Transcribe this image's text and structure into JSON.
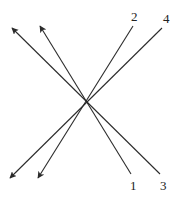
{
  "diagram": {
    "intersection": {
      "x": 85,
      "y": 103
    },
    "lines": [
      {
        "id": "1",
        "label": "1",
        "from": {
          "x": 131,
          "y": 174
        },
        "to": {
          "x": 40,
          "y": 26
        },
        "arrow_at": "to",
        "label_pos": {
          "x": 130,
          "y": 190
        }
      },
      {
        "id": "3",
        "label": "3",
        "from": {
          "x": 160,
          "y": 174
        },
        "to": {
          "x": 12,
          "y": 28
        },
        "arrow_at": "to",
        "label_pos": {
          "x": 160,
          "y": 190
        }
      },
      {
        "id": "2",
        "label": "2",
        "from": {
          "x": 133,
          "y": 26
        },
        "to": {
          "x": 38,
          "y": 178
        },
        "arrow_at": "to",
        "label_pos": {
          "x": 131,
          "y": 21
        }
      },
      {
        "id": "4",
        "label": "4",
        "from": {
          "x": 162,
          "y": 28
        },
        "to": {
          "x": 10,
          "y": 178
        },
        "arrow_at": "to",
        "label_pos": {
          "x": 163,
          "y": 23
        }
      }
    ],
    "colors": {
      "line": "#2b2b2b",
      "background": "#ffffff",
      "label": "#222222"
    }
  }
}
